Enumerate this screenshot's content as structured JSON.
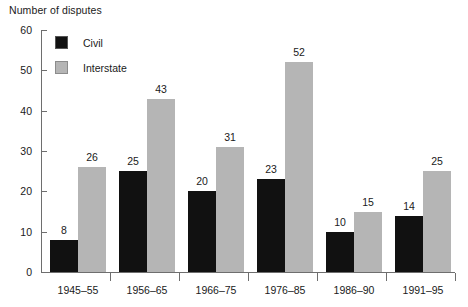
{
  "chart_data": {
    "type": "bar",
    "title": "Number of disputes",
    "xlabel": "",
    "ylabel": "Number of disputes",
    "ylim": [
      0,
      60
    ],
    "yticks": [
      0,
      10,
      20,
      30,
      40,
      50,
      60
    ],
    "grid": false,
    "legend_position": "upper-left-inside",
    "categories": [
      "1945–55",
      "1956–65",
      "1966–75",
      "1976–85",
      "1986–90",
      "1991–95"
    ],
    "series": [
      {
        "name": "Civil",
        "color": "#111111",
        "values": [
          8,
          25,
          20,
          23,
          10,
          14
        ]
      },
      {
        "name": "Interstate",
        "color": "#b5b5b5",
        "values": [
          26,
          43,
          31,
          52,
          15,
          25
        ]
      }
    ],
    "data_labels": true,
    "axis_color": "#6e6e6e",
    "text_color": "#1a1a1a",
    "background": "#ffffff"
  }
}
